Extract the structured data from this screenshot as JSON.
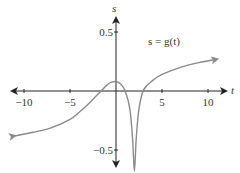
{
  "chart_data": {
    "type": "line",
    "title": "",
    "xlabel": "t",
    "ylabel": "s",
    "annotation": "s = g(t)",
    "xlim": [
      -11.5,
      12
    ],
    "ylim": [
      -0.68,
      0.62
    ],
    "grid": false,
    "legend": null,
    "x_ticks": [
      -10,
      -5,
      5,
      10
    ],
    "x_tick_labels": [
      "−10",
      "−5",
      "5",
      "10"
    ],
    "y_ticks": [
      0.5,
      -0.5
    ],
    "y_tick_labels": [
      "0.5",
      "−0.5"
    ],
    "series": [
      {
        "name": "g(t)",
        "color": "#8a8a8a",
        "x": [
          -11,
          -9,
          -7,
          -5,
          -4,
          -3,
          -2,
          -1.5,
          -1,
          -0.5,
          0,
          0.5,
          1,
          1.5,
          1.8,
          2,
          2.2,
          2.5,
          3,
          4,
          5,
          7,
          9,
          11
        ],
        "y": [
          -0.38,
          -0.35,
          -0.31,
          -0.24,
          -0.18,
          -0.11,
          -0.03,
          0.01,
          0.05,
          0.075,
          0.08,
          0.06,
          0.0,
          -0.15,
          -0.4,
          -0.68,
          -0.4,
          -0.15,
          0.01,
          0.09,
          0.14,
          0.2,
          0.24,
          0.27
        ]
      }
    ]
  }
}
